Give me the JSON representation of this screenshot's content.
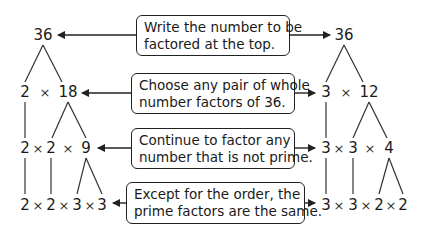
{
  "callouts": [
    {
      "line1": "Write the number to be",
      "line2": "factored at the top."
    },
    {
      "line1": "Choose any pair of whole",
      "line2": "number factors of 36."
    },
    {
      "line1": "Continue to factor any",
      "line2": "number that is not prime."
    },
    {
      "line1": "Except for the order, the",
      "line2": "prime factors are the same."
    }
  ],
  "operator": "×",
  "left_tree": {
    "root": "36",
    "level1": [
      "2",
      "18"
    ],
    "level2": [
      "2",
      "2",
      "9"
    ],
    "level3": [
      "2",
      "2",
      "3",
      "3"
    ]
  },
  "right_tree": {
    "root": "36",
    "level1": [
      "3",
      "12"
    ],
    "level2": [
      "3",
      "3",
      "4"
    ],
    "level3": [
      "3",
      "3",
      "2",
      "2"
    ]
  },
  "colors": {
    "ink": "#1a1a1a",
    "background": "#ffffff"
  }
}
